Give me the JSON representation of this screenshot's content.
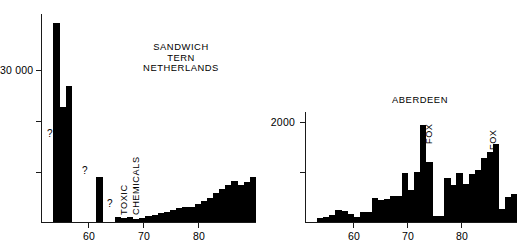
{
  "figure": {
    "background": "#ffffff",
    "ink_color": "#000000"
  },
  "chart_data": [
    {
      "id": "sandwich-tern-netherlands",
      "type": "bar",
      "title": "SANDWICH\nTERN\nNETHERLANDS",
      "title_lines": [
        "SANDWICH",
        "TERN",
        "NETHERLANDS"
      ],
      "xlabel": "",
      "ylabel": "",
      "ylim": [
        0,
        46000
      ],
      "xlim": [
        53,
        88
      ],
      "grid": false,
      "legend": null,
      "y_ticks": [
        {
          "value": 10000,
          "label": ""
        },
        {
          "value": 20000,
          "label": ""
        },
        {
          "value": 30000,
          "label": "30 000"
        }
      ],
      "y_tick_labels": [
        "30 000"
      ],
      "x_ticks": [
        60,
        70,
        80
      ],
      "x_tick_labels": [
        "60",
        "70",
        "80"
      ],
      "annotations": [
        {
          "text": "?",
          "x": 54.2,
          "y": 19500
        },
        {
          "text": "?",
          "x": 60.5,
          "y": 9000
        },
        {
          "text": "?",
          "x": 63.6,
          "y": 2200
        },
        {
          "text": "TOXIC",
          "x": 64.9,
          "y": 3000,
          "rotation": -90
        },
        {
          "text": "CHEMICALS",
          "x": 66.3,
          "y": 3000,
          "rotation": -90
        }
      ],
      "categories": [
        54,
        55,
        56,
        57,
        58,
        59,
        60,
        61,
        62,
        63,
        64,
        65,
        66,
        67,
        68,
        69,
        70,
        71,
        72,
        73,
        74,
        75,
        76,
        77,
        78,
        79,
        80,
        81,
        82,
        83,
        84,
        85,
        86,
        87
      ],
      "values": [
        0,
        44000,
        25500,
        30000,
        0,
        0,
        0,
        0,
        9900,
        0,
        0,
        1100,
        800,
        1000,
        700,
        900,
        1250,
        1600,
        1900,
        2200,
        2700,
        3000,
        3400,
        3300,
        4000,
        4600,
        5300,
        6400,
        7400,
        8100,
        9000,
        8200,
        8800,
        10000
      ]
    },
    {
      "id": "aberdeen",
      "type": "bar",
      "title": "ABERDEEN",
      "title_lines": [
        "ABERDEEN"
      ],
      "xlabel": "",
      "ylabel": "",
      "ylim": [
        0,
        2400
      ],
      "xlim": [
        53,
        88
      ],
      "grid": false,
      "legend": null,
      "y_ticks": [
        {
          "value": 1000,
          "label": ""
        },
        {
          "value": 2000,
          "label": "2000"
        }
      ],
      "y_tick_labels": [
        "2000"
      ],
      "x_ticks": [
        60,
        70,
        80
      ],
      "x_tick_labels": [
        "60",
        "70",
        "80"
      ],
      "annotations": [
        {
          "text": "FOX",
          "x": 72.6,
          "y": 1300,
          "rotation": -90
        },
        {
          "text": "FOX",
          "x": 84.6,
          "y": 1250,
          "rotation": -90
        }
      ],
      "categories": [
        54,
        55,
        56,
        57,
        58,
        59,
        60,
        61,
        62,
        63,
        64,
        65,
        66,
        67,
        68,
        69,
        70,
        71,
        72,
        73,
        74,
        75,
        76,
        77,
        78,
        79,
        80,
        81,
        82,
        83,
        84,
        85,
        86,
        87
      ],
      "values": [
        0,
        90,
        110,
        150,
        270,
        230,
        170,
        110,
        210,
        220,
        520,
        480,
        500,
        560,
        560,
        1060,
        700,
        1090,
        2120,
        1320,
        130,
        130,
        960,
        800,
        1060,
        820,
        1050,
        1130,
        1400,
        1520,
        1700,
        280,
        540,
        620
      ]
    }
  ]
}
